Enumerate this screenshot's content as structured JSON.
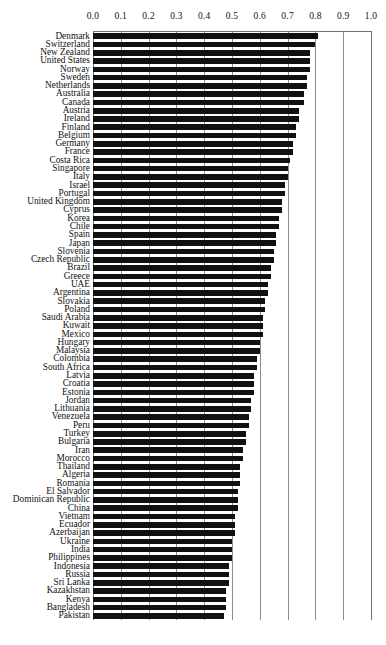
{
  "chart": {
    "type": "bar",
    "orientation": "horizontal",
    "title": "",
    "xlabel": "",
    "ylabel": ""
  },
  "axis": {
    "tick_labels": [
      "0.0",
      "0.1",
      "0.2",
      "0.3",
      "0.4",
      "0.5",
      "0.6",
      "0.7",
      "0.8",
      "0.9",
      "1.0"
    ],
    "min": 0.0,
    "max": 1.0,
    "step": 0.1,
    "position": "top",
    "grid": true
  },
  "chart_data": {
    "type": "bar",
    "orientation": "horizontal",
    "title": "",
    "xlabel": "",
    "ylabel": "",
    "xlim": [
      0.0,
      1.0
    ],
    "xticks": [
      0.0,
      0.1,
      0.2,
      0.3,
      0.4,
      0.5,
      0.6,
      0.7,
      0.8,
      0.9,
      1.0
    ],
    "grid": true,
    "legend": "none",
    "bar_color": "#111111",
    "categories": [
      "Denmark",
      "Switzerland",
      "New Zealand",
      "United States",
      "Norway",
      "Sweden",
      "Netherlands",
      "Australia",
      "Canada",
      "Austria",
      "Ireland",
      "Finland",
      "Belgium",
      "Germany",
      "France",
      "Costa Rica",
      "Singapore",
      "Italy",
      "Israel",
      "Portugal",
      "United Kingdom",
      "Cyprus",
      "Korea",
      "Chile",
      "Spain",
      "Japan",
      "Slovenia",
      "Czech Republic",
      "Brazil",
      "Greece",
      "UAE",
      "Argentina",
      "Slovakia",
      "Poland",
      "Saudi Arabia",
      "Kuwait",
      "Mexico",
      "Hungary",
      "Malaysia",
      "Colombia",
      "South Africa",
      "Latvia",
      "Croatia",
      "Estonia",
      "Jordan",
      "Lithuania",
      "Venezuela",
      "Peru",
      "Turkey",
      "Bulgaria",
      "Iran",
      "Morocco",
      "Thailand",
      "Algeria",
      "Romania",
      "El Salvador",
      "Dominican Republic",
      "China",
      "Vietnam",
      "Ecuador",
      "Azerbaijan",
      "Ukraine",
      "India",
      "Philippines",
      "Indonesia",
      "Russia",
      "Sri Lanka",
      "Kazakhstan",
      "Kenya",
      "Bangladesh",
      "Pakistan"
    ],
    "values": [
      0.81,
      0.8,
      0.78,
      0.78,
      0.78,
      0.77,
      0.77,
      0.76,
      0.76,
      0.74,
      0.74,
      0.73,
      0.73,
      0.72,
      0.72,
      0.71,
      0.7,
      0.7,
      0.69,
      0.69,
      0.68,
      0.68,
      0.67,
      0.67,
      0.66,
      0.66,
      0.65,
      0.65,
      0.64,
      0.64,
      0.63,
      0.63,
      0.62,
      0.62,
      0.61,
      0.61,
      0.61,
      0.6,
      0.6,
      0.59,
      0.59,
      0.58,
      0.58,
      0.58,
      0.57,
      0.57,
      0.56,
      0.56,
      0.55,
      0.55,
      0.54,
      0.54,
      0.53,
      0.53,
      0.53,
      0.52,
      0.52,
      0.52,
      0.51,
      0.51,
      0.51,
      0.5,
      0.5,
      0.5,
      0.49,
      0.49,
      0.49,
      0.48,
      0.48,
      0.48,
      0.47
    ]
  }
}
